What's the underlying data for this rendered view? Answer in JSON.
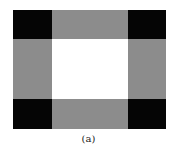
{
  "figure": {
    "caption": "(a)",
    "colors": {
      "corner": "#050505",
      "edge": "#8c8c8c",
      "center": "#ffffff"
    },
    "cells": [
      {
        "id": "top-left",
        "type": "corner"
      },
      {
        "id": "top-middle",
        "type": "edge"
      },
      {
        "id": "top-right",
        "type": "corner"
      },
      {
        "id": "middle-left",
        "type": "edge"
      },
      {
        "id": "center",
        "type": "center"
      },
      {
        "id": "middle-right",
        "type": "edge"
      },
      {
        "id": "bottom-left",
        "type": "corner"
      },
      {
        "id": "bottom-middle",
        "type": "edge"
      },
      {
        "id": "bottom-right",
        "type": "corner"
      }
    ]
  }
}
